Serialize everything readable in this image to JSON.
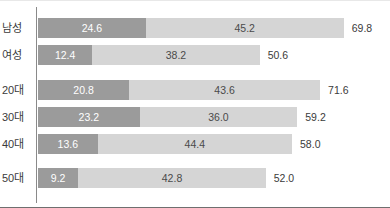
{
  "chart_data": {
    "type": "bar",
    "orientation": "horizontal",
    "stacked": true,
    "title": "",
    "xlabel": "",
    "ylabel": "",
    "xlim": [
      0,
      78
    ],
    "grid": false,
    "legend": "none",
    "categories": [
      "남성",
      "여성",
      "20대",
      "30대",
      "40대",
      "50대"
    ],
    "series": [
      {
        "name": "segment-1",
        "color": "#9b9b9b",
        "values": [
          24.6,
          12.4,
          20.8,
          23.2,
          13.6,
          9.2
        ]
      },
      {
        "name": "segment-2",
        "color": "#d5d5d5",
        "values": [
          45.2,
          38.2,
          43.6,
          36.0,
          44.4,
          42.8
        ]
      }
    ],
    "totals": [
      69.8,
      50.6,
      71.6,
      59.2,
      58.0,
      52.0
    ],
    "rows": [
      {
        "label": "남성",
        "seg1_value": 24.6,
        "seg1_text": "24.6",
        "seg2_value": 45.2,
        "seg2_text": "45.2",
        "total_value": 69.8,
        "total_text": "69.8"
      },
      {
        "label": "여성",
        "seg1_value": 12.4,
        "seg1_text": "12.4",
        "seg2_value": 38.2,
        "seg2_text": "38.2",
        "total_value": 50.6,
        "total_text": "50.6"
      },
      {
        "label": "20대",
        "seg1_value": 20.8,
        "seg1_text": "20.8",
        "seg2_value": 43.6,
        "seg2_text": "43.6",
        "total_value": 71.6,
        "total_text": "71.6"
      },
      {
        "label": "30대",
        "seg1_value": 23.2,
        "seg1_text": "23.2",
        "seg2_value": 36.0,
        "seg2_text": "36.0",
        "total_value": 59.2,
        "total_text": "59.2"
      },
      {
        "label": "40대",
        "seg1_value": 13.6,
        "seg1_text": "13.6",
        "seg2_value": 44.4,
        "seg2_text": "44.4",
        "total_value": 58.0,
        "total_text": "58.0"
      },
      {
        "label": "50대",
        "seg1_value": 9.2,
        "seg1_text": "9.2",
        "seg2_value": 42.8,
        "seg2_text": "42.8",
        "total_value": 52.0,
        "total_text": "52.0"
      }
    ]
  },
  "layout": {
    "axis_x_px": 36,
    "bar_start_px": 38,
    "px_per_unit": 4.38,
    "row_tops_px": [
      16,
      43,
      78,
      105,
      132,
      166
    ],
    "bar_height_px": 20,
    "total_label_gap_px": 8
  },
  "colors": {
    "segment_1": "#9b9b9b",
    "segment_2": "#d5d5d5",
    "axis": "#8a8a8a",
    "bottom_border": "#6f6f6f",
    "label_text": "#3b3b3b",
    "value_on_dark": "#ffffff",
    "value_on_light": "#4a4a4a"
  }
}
